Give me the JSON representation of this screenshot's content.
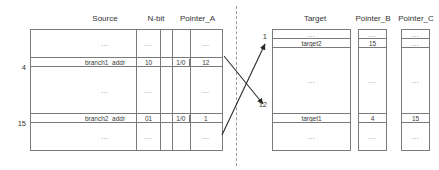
{
  "diagram": {
    "title": "",
    "ellipsis": "...",
    "columns": [
      {
        "id": "source",
        "title": "Source",
        "rows": [
          {
            "type": "dots",
            "value": "..."
          },
          {
            "type": "highlight",
            "value": "branch1_addr",
            "index": "4"
          },
          {
            "type": "dots",
            "value": "..."
          },
          {
            "type": "highlight",
            "value": "branch2_addr",
            "index": "15"
          },
          {
            "type": "dots",
            "value": "..."
          }
        ]
      },
      {
        "id": "nbit",
        "title": "N-bit",
        "rows": [
          {
            "type": "dots",
            "value": "..."
          },
          {
            "type": "highlight",
            "value": "10"
          },
          {
            "type": "dots",
            "value": "..."
          },
          {
            "type": "highlight",
            "value": "01"
          },
          {
            "type": "dots",
            "value": "..."
          }
        ]
      },
      {
        "id": "pointer_a",
        "title": "Pointer_A",
        "split": true,
        "rows": [
          {
            "type": "dots",
            "left": "",
            "value": "..."
          },
          {
            "type": "highlight",
            "left": "1/0",
            "value": "12"
          },
          {
            "type": "dots",
            "left": "",
            "value": "..."
          },
          {
            "type": "highlight",
            "left": "1/0",
            "value": "1"
          },
          {
            "type": "dots",
            "left": "",
            "value": "..."
          }
        ]
      },
      {
        "id": "target",
        "title": "Target",
        "rows": [
          {
            "type": "dots",
            "value": "..."
          },
          {
            "type": "highlight",
            "value": "target2",
            "index": "1"
          },
          {
            "type": "dots",
            "value": "..."
          },
          {
            "type": "highlight",
            "value": "target1",
            "index": "12"
          },
          {
            "type": "dots",
            "value": "..."
          }
        ]
      },
      {
        "id": "pointer_b",
        "title": "Pointer_B",
        "rows": [
          {
            "type": "dots",
            "value": "..."
          },
          {
            "type": "highlight",
            "value": "15"
          },
          {
            "type": "dots",
            "value": "..."
          },
          {
            "type": "highlight",
            "value": "4"
          },
          {
            "type": "dots",
            "value": "..."
          }
        ]
      },
      {
        "id": "pointer_c",
        "title": "Pointer_C",
        "rows": [
          {
            "type": "dots",
            "value": "..."
          },
          {
            "type": "highlight",
            "value": "..."
          },
          {
            "type": "dots",
            "value": "..."
          },
          {
            "type": "highlight",
            "value": "15"
          },
          {
            "type": "dots",
            "value": "..."
          }
        ]
      }
    ],
    "indices": {
      "source_branch1": "4",
      "source_branch2": "15",
      "target_target2": "1",
      "target_target1": "12"
    },
    "arrows": [
      {
        "id": "arrow-up-right",
        "from": "lower-left",
        "to": "target-row-1"
      },
      {
        "id": "arrow-down-right",
        "from": "upper-left",
        "to": "target-row-12"
      }
    ],
    "separator": {
      "style": "dashed-vertical"
    },
    "colors": {
      "line": "#7a7a7a",
      "text": "#3a3a3a",
      "dashed": "#9a9a9a"
    }
  }
}
